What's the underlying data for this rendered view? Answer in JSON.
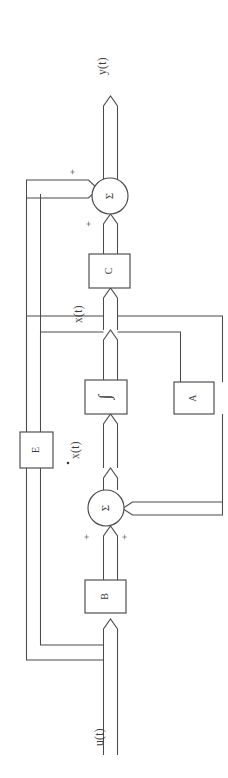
{
  "diagram": {
    "orientation": "rotated-90-ccw",
    "stroke_color": "#4a4a4a",
    "text_color": "#3c3c3c",
    "background": "#ffffff",
    "blocks": [
      {
        "id": "C",
        "label": "C",
        "shape": "rectangle"
      },
      {
        "id": "integrator",
        "label": "∫",
        "shape": "rectangle"
      },
      {
        "id": "A",
        "label": "A",
        "shape": "rectangle"
      },
      {
        "id": "E",
        "label": "E",
        "shape": "rectangle"
      },
      {
        "id": "B",
        "label": "B",
        "shape": "rectangle"
      }
    ],
    "summing_junctions": [
      {
        "id": "sum-output",
        "glyph": "Σ",
        "signs": [
          "+",
          "+"
        ]
      },
      {
        "id": "sum-state",
        "glyph": "Σ",
        "signs": [
          "+",
          "+"
        ]
      }
    ],
    "signals": [
      {
        "id": "y",
        "label": "y(t)"
      },
      {
        "id": "x",
        "label": "x(t)"
      },
      {
        "id": "xdot",
        "label": "x(t)",
        "dot": true
      },
      {
        "id": "u",
        "label": "u(t)"
      }
    ],
    "signs": {
      "sum_output_plus_1": "+",
      "sum_output_plus_2": "+",
      "sum_state_plus_1": "+",
      "sum_state_plus_2": "+"
    }
  }
}
